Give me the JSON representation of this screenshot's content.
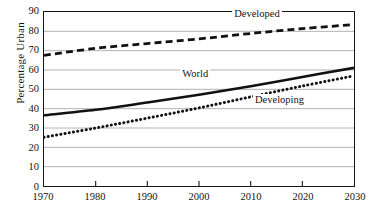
{
  "chart_data": {
    "type": "line",
    "title": "",
    "subtitle": "",
    "xlabel": "",
    "ylabel": "Percentage Urban",
    "xlim": [
      1970,
      2030
    ],
    "ylim": [
      0,
      90
    ],
    "xticks": [
      1970,
      1980,
      1990,
      2000,
      2010,
      2020,
      2030
    ],
    "yticks": [
      0,
      10,
      20,
      30,
      40,
      50,
      60,
      70,
      80,
      90
    ],
    "grid": "horizontal",
    "legend_position": "inline-annotations",
    "x": [
      1970,
      1980,
      1990,
      2000,
      2010,
      2020,
      2030
    ],
    "series": [
      {
        "name": "Developed",
        "style": "dashed",
        "color": "#111111",
        "values": [
          67.6,
          71.2,
          73.7,
          76.1,
          78.9,
          81.4,
          83.5
        ]
      },
      {
        "name": "World",
        "style": "solid",
        "color": "#111111",
        "values": [
          36.6,
          39.4,
          43.2,
          47.2,
          51.6,
          56.4,
          61.1
        ]
      },
      {
        "name": "Developing",
        "style": "dotted",
        "color": "#111111",
        "values": [
          25.2,
          30.0,
          35.1,
          40.4,
          46.1,
          51.7,
          57.0
        ]
      }
    ],
    "annotations": [
      {
        "text": "Developed",
        "x": 2011,
        "y": 88.5
      },
      {
        "text": "World",
        "x": 2001,
        "y": 58.0
      },
      {
        "text": "Developing",
        "x": 2015,
        "y": 44.5
      }
    ]
  },
  "axis": {
    "y_title": "Percentage Urban",
    "y_tick_labels": [
      "90",
      "80",
      "70",
      "60",
      "50",
      "40",
      "30",
      "20",
      "10",
      "0"
    ],
    "x_tick_labels": [
      "1970",
      "1980",
      "1990",
      "2000",
      "2010",
      "2020",
      "2030"
    ]
  },
  "colors": {
    "axis_line": "#151515",
    "gridline": "#a8a8a8",
    "series_line": "#111111",
    "text": "#141414",
    "background": "#ffffff"
  }
}
